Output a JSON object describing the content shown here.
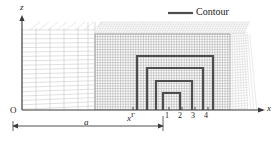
{
  "figure": {
    "domain": "chart",
    "background": "#ffffff",
    "legend": {
      "label": "Contour",
      "line_color": "#4d4d4d",
      "line_width": 2.2
    },
    "axes": {
      "x_label": "x",
      "z_label": "z",
      "origin_label": "O",
      "axis_color": "#3a3a3a",
      "x_axis_y": 110,
      "z_axis_x": 22,
      "x_axis_x0": 22,
      "x_axis_x1": 264,
      "z_axis_y0": 16,
      "z_axis_y1": 110
    },
    "dimension": {
      "label": "a",
      "start_x": 13,
      "end_x": 163,
      "y": 126
    },
    "markers": {
      "interface_label": "x",
      "interface_superscript": "Γ",
      "interface_x": 133,
      "tick_labels": [
        "1",
        "2",
        "3",
        "4"
      ],
      "tick_x": [
        167,
        180,
        193,
        206
      ]
    },
    "mesh": {
      "coarse_color": "#b9b9b9",
      "fine_color": "#9a9a9a",
      "fan_color": "#cccccc",
      "coarse_x0": 22,
      "coarse_x1": 95,
      "fine_x0": 95,
      "fine_x1": 245,
      "mesh_top": 22,
      "fine_top": 34
    }
  },
  "chart_data": {
    "type": "line",
    "title": "",
    "xlabel": "x",
    "ylabel": "z",
    "legend": [
      "Contour"
    ],
    "legend_position": "top-right",
    "grid": true,
    "annotations": [
      "O",
      "a",
      "xΓ",
      "1",
      "2",
      "3",
      "4"
    ],
    "series": [
      {
        "name": "Contour 4",
        "comment": "outermost nested rectangular contour",
        "points": [
          [
            137,
            110
          ],
          [
            137,
            56
          ],
          [
            213,
            56
          ],
          [
            213,
            110
          ]
        ]
      },
      {
        "name": "Contour 3",
        "comment": "second nested rectangular contour",
        "points": [
          [
            147,
            110
          ],
          [
            147,
            68
          ],
          [
            203,
            68
          ],
          [
            203,
            110
          ]
        ]
      },
      {
        "name": "Contour 2",
        "comment": "third nested rectangular contour",
        "points": [
          [
            156,
            110
          ],
          [
            156,
            81
          ],
          [
            192,
            81
          ],
          [
            192,
            110
          ]
        ]
      },
      {
        "name": "Contour 1",
        "comment": "innermost nested rectangular contour",
        "points": [
          [
            163,
            110
          ],
          [
            163,
            93
          ],
          [
            180,
            93
          ],
          [
            180,
            110
          ]
        ]
      }
    ],
    "xlim": [
      0,
      279
    ],
    "ylim": [
      0,
      142
    ]
  }
}
